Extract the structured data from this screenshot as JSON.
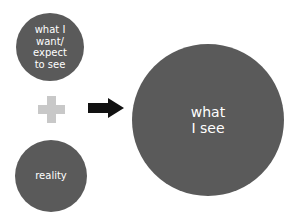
{
  "diagram": {
    "nodes": [
      {
        "id": "want",
        "label": "what I\nwant/\nexpect\nto see"
      },
      {
        "id": "reality",
        "label": "reality"
      },
      {
        "id": "see",
        "label": "what\nI see"
      }
    ],
    "operators": {
      "plus": "plus-icon",
      "arrow": "right-arrow-icon"
    },
    "colors": {
      "circle": "#5a5a5a",
      "plus": "#c8c8c8",
      "arrow": "#111111",
      "text": "#ffffff"
    }
  }
}
